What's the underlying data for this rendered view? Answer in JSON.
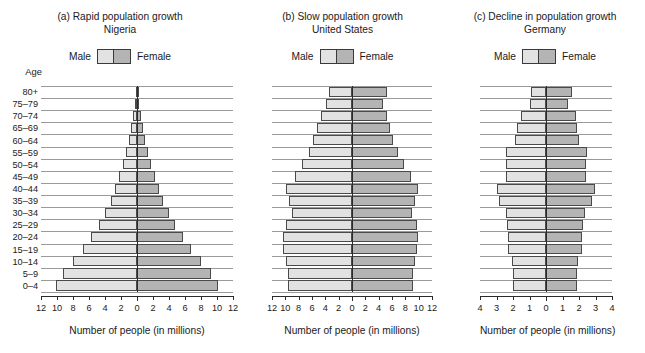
{
  "figure": {
    "age_axis_header": "Age",
    "legend": {
      "male_label": "Male",
      "female_label": "Female"
    },
    "axis_caption": "Number of people (in millions)",
    "colors": {
      "male": "#e2e2e2",
      "female": "#b4b4b4",
      "gridline": "#9a9a9a",
      "axis": "#2b2b2b",
      "bar_outline": "#4a4a4a"
    }
  },
  "age_groups": [
    "80+",
    "75–79",
    "70–74",
    "65–69",
    "60–64",
    "55–59",
    "50–54",
    "45–49",
    "40–44",
    "35–39",
    "30–34",
    "25–29",
    "20–24",
    "15–19",
    "10–14",
    "5–9",
    "0–4"
  ],
  "panels": [
    {
      "id": "a",
      "title": "(a) Rapid population growth",
      "subtitle": "Nigeria",
      "xmax": 12,
      "xticks": [
        12,
        10,
        8,
        6,
        4,
        2,
        0,
        2,
        4,
        6,
        8,
        10,
        12
      ]
    },
    {
      "id": "b",
      "title": "(b) Slow population growth",
      "subtitle": "United States",
      "xmax": 12,
      "xticks": [
        12,
        10,
        8,
        6,
        4,
        2,
        0,
        2,
        4,
        6,
        8,
        10,
        12
      ]
    },
    {
      "id": "c",
      "title": "(c) Decline in population growth",
      "subtitle": "Germany",
      "xmax": 4,
      "xticks": [
        4,
        3,
        2,
        1,
        0,
        1,
        2,
        3,
        4
      ]
    }
  ],
  "chart_data": [
    {
      "type": "bar",
      "title": "(a) Rapid population growth",
      "subtitle": "Nigeria",
      "orientation": "population-pyramid",
      "categories": [
        "80+",
        "75–79",
        "70–74",
        "65–69",
        "60–64",
        "55–59",
        "50–54",
        "45–49",
        "40–44",
        "35–39",
        "30–34",
        "25–29",
        "20–24",
        "15–19",
        "10–14",
        "5–9",
        "0–4"
      ],
      "series": [
        {
          "name": "Male",
          "side": "left",
          "values": [
            0.12,
            0.3,
            0.5,
            0.75,
            1.0,
            1.35,
            1.75,
            2.2,
            2.7,
            3.3,
            4.0,
            4.8,
            5.7,
            6.8,
            8.0,
            9.2,
            10.1
          ]
        },
        {
          "name": "Female",
          "side": "right",
          "values": [
            0.12,
            0.3,
            0.5,
            0.75,
            1.0,
            1.35,
            1.75,
            2.2,
            2.7,
            3.3,
            4.0,
            4.8,
            5.7,
            6.8,
            8.0,
            9.2,
            10.1
          ]
        }
      ],
      "xlabel": "Number of people (in millions)",
      "ylabel": "Age",
      "xlim": [
        -12,
        12
      ],
      "xticks": [
        12,
        10,
        8,
        6,
        4,
        2,
        0,
        2,
        4,
        6,
        8,
        10,
        12
      ],
      "grid": true,
      "legend": [
        "Male",
        "Female"
      ],
      "legend_position": "top-center"
    },
    {
      "type": "bar",
      "title": "(b) Slow population growth",
      "subtitle": "United States",
      "orientation": "population-pyramid",
      "categories": [
        "80+",
        "75–79",
        "70–74",
        "65–69",
        "60–64",
        "55–59",
        "50–54",
        "45–49",
        "40–44",
        "35–39",
        "30–34",
        "25–29",
        "20–24",
        "15–19",
        "10–14",
        "5–9",
        "0–4"
      ],
      "series": [
        {
          "name": "Male",
          "side": "left",
          "values": [
            3.4,
            3.9,
            4.6,
            5.2,
            5.8,
            6.5,
            7.5,
            8.6,
            9.9,
            9.4,
            9.0,
            9.9,
            10.3,
            10.3,
            9.9,
            9.6,
            9.6
          ]
        },
        {
          "name": "Female",
          "side": "right",
          "values": [
            5.2,
            4.7,
            5.2,
            5.7,
            6.2,
            6.9,
            7.8,
            8.8,
            9.9,
            9.4,
            9.0,
            9.7,
            9.9,
            9.8,
            9.5,
            9.2,
            9.2
          ]
        }
      ],
      "xlabel": "Number of people (in millions)",
      "ylabel": "Age",
      "xlim": [
        -12,
        12
      ],
      "xticks": [
        12,
        10,
        8,
        6,
        4,
        2,
        0,
        2,
        4,
        6,
        8,
        10,
        12
      ],
      "grid": true,
      "legend": [
        "Male",
        "Female"
      ],
      "legend_position": "top-center"
    },
    {
      "type": "bar",
      "title": "(c) Decline in population growth",
      "subtitle": "Germany",
      "orientation": "population-pyramid",
      "categories": [
        "80+",
        "75–79",
        "70–74",
        "65–69",
        "60–64",
        "55–59",
        "50–54",
        "45–49",
        "40–44",
        "35–39",
        "30–34",
        "25–29",
        "20–24",
        "15–19",
        "10–14",
        "5–9",
        "0–4"
      ],
      "series": [
        {
          "name": "Male",
          "side": "left",
          "values": [
            0.9,
            0.95,
            1.5,
            1.75,
            1.9,
            2.45,
            2.4,
            2.4,
            3.0,
            2.85,
            2.45,
            2.35,
            2.3,
            2.3,
            2.05,
            2.0,
            2.0
          ]
        },
        {
          "name": "Female",
          "side": "right",
          "values": [
            1.6,
            1.35,
            1.8,
            1.9,
            2.0,
            2.5,
            2.4,
            2.4,
            2.95,
            2.8,
            2.35,
            2.25,
            2.2,
            2.2,
            1.95,
            1.9,
            1.9
          ]
        }
      ],
      "xlabel": "Number of people (in millions)",
      "ylabel": "Age",
      "xlim": [
        -4,
        4
      ],
      "xticks": [
        4,
        3,
        2,
        1,
        0,
        1,
        2,
        3,
        4
      ],
      "grid": true,
      "legend": [
        "Male",
        "Female"
      ],
      "legend_position": "top-center"
    }
  ]
}
